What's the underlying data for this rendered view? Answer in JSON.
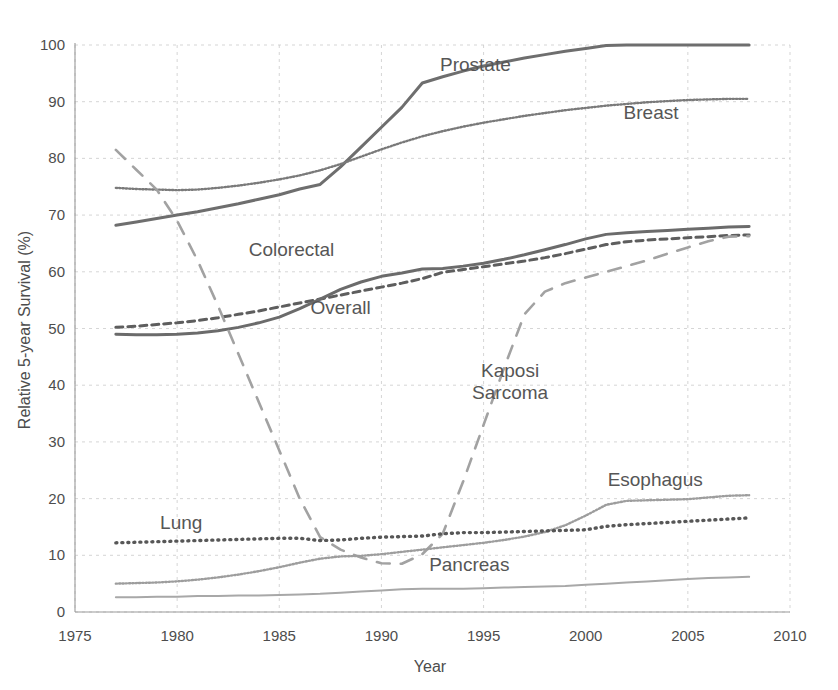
{
  "chart_data": {
    "type": "line",
    "title": "",
    "xlabel": "Year",
    "ylabel": "Relative 5-year Survival (%)",
    "xlim": [
      1975,
      2010
    ],
    "ylim": [
      0,
      100
    ],
    "xticks": [
      "1975",
      "1980",
      "1985",
      "1990",
      "1995",
      "2000",
      "2005",
      "2010"
    ],
    "yticks": [
      "0",
      "10",
      "20",
      "30",
      "40",
      "50",
      "60",
      "70",
      "80",
      "90",
      "100"
    ],
    "grid": true,
    "legend_position": "inline-annotations",
    "x": [
      1977,
      1978,
      1979,
      1980,
      1981,
      1982,
      1983,
      1984,
      1985,
      1986,
      1987,
      1988,
      1989,
      1990,
      1991,
      1992,
      1993,
      1994,
      1995,
      1996,
      1997,
      1998,
      1999,
      2000,
      2001,
      2002,
      2003,
      2004,
      2005,
      2006,
      2007,
      2008
    ],
    "series": [
      {
        "name": "Prostate",
        "color": "#6e6e6e",
        "style": "solid",
        "label_x": 1994.6,
        "label_y": 95.5,
        "values": [
          68.2,
          68.8,
          69.4,
          70.0,
          70.6,
          71.3,
          72.0,
          72.8,
          73.6,
          74.6,
          75.4,
          78.5,
          82.0,
          85.5,
          89.0,
          93.3,
          94.4,
          95.4,
          96.3,
          97.0,
          97.7,
          98.3,
          98.9,
          99.4,
          99.9,
          100.0,
          100.0,
          100.0,
          100.0,
          100.0,
          100.0,
          100.0
        ]
      },
      {
        "name": "Breast",
        "color": "#7a7a7a",
        "style": "dotted-fine",
        "label_x": 2003.2,
        "label_y": 87.0,
        "values": [
          74.8,
          74.6,
          74.5,
          74.4,
          74.5,
          74.8,
          75.2,
          75.7,
          76.3,
          77.0,
          77.9,
          79.0,
          80.3,
          81.6,
          82.8,
          83.9,
          84.8,
          85.6,
          86.3,
          86.9,
          87.5,
          88.0,
          88.5,
          88.9,
          89.3,
          89.6,
          89.9,
          90.1,
          90.3,
          90.4,
          90.5,
          90.5
        ]
      },
      {
        "name": "Colorectal",
        "color": "#5e5e5e",
        "style": "dashed",
        "label_x": 1985.6,
        "label_y": 62.8,
        "values": [
          50.2,
          50.4,
          50.7,
          51.0,
          51.4,
          51.9,
          52.5,
          53.1,
          53.8,
          54.5,
          55.2,
          55.9,
          56.6,
          57.3,
          58.0,
          58.8,
          59.9,
          60.4,
          60.9,
          61.4,
          61.9,
          62.5,
          63.2,
          64.0,
          64.8,
          65.3,
          65.6,
          65.8,
          66.0,
          66.2,
          66.4,
          66.5
        ]
      },
      {
        "name": "Overall",
        "color": "#6b6b6b",
        "style": "solid",
        "label_x": 1988.0,
        "label_y": 52.5,
        "values": [
          49.0,
          48.9,
          48.9,
          49.0,
          49.2,
          49.6,
          50.2,
          51.0,
          52.0,
          53.5,
          55.2,
          56.9,
          58.2,
          59.2,
          59.8,
          60.5,
          60.6,
          61.0,
          61.5,
          62.2,
          63.0,
          63.9,
          64.8,
          65.8,
          66.6,
          66.9,
          67.1,
          67.3,
          67.5,
          67.7,
          67.9,
          68.0
        ]
      },
      {
        "name": "Kaposi Sarcoma",
        "color": "#a2a2a2",
        "style": "long-dash",
        "label_x": 1996.3,
        "label_y": 41.5,
        "values": [
          81.5,
          78.0,
          74.5,
          69.0,
          62.0,
          54.0,
          45.5,
          37.0,
          28.5,
          20.0,
          13.2,
          11.0,
          9.6,
          8.6,
          8.5,
          10.2,
          13.8,
          23.0,
          33.0,
          43.0,
          52.5,
          56.5,
          58.0,
          59.0,
          60.0,
          61.0,
          62.0,
          63.2,
          64.3,
          65.4,
          66.2,
          66.3
        ]
      },
      {
        "name": "Esophagus",
        "color": "#9d9d9d",
        "style": "dotted-fine",
        "label_x": 2003.4,
        "label_y": 22.3,
        "values": [
          5.0,
          5.1,
          5.2,
          5.4,
          5.7,
          6.1,
          6.6,
          7.2,
          7.9,
          8.7,
          9.4,
          9.8,
          9.9,
          10.2,
          10.6,
          11.0,
          11.4,
          11.8,
          12.2,
          12.7,
          13.3,
          14.1,
          15.3,
          17.0,
          18.9,
          19.6,
          19.7,
          19.8,
          19.9,
          20.2,
          20.5,
          20.6
        ]
      },
      {
        "name": "Lung",
        "color": "#575757",
        "style": "dotted-thick",
        "label_x": 1980.2,
        "label_y": 14.6,
        "values": [
          12.2,
          12.3,
          12.4,
          12.5,
          12.6,
          12.7,
          12.8,
          12.9,
          13.0,
          13.0,
          12.6,
          12.7,
          13.0,
          13.2,
          13.3,
          13.4,
          13.8,
          14.0,
          14.0,
          14.1,
          14.2,
          14.3,
          14.4,
          14.5,
          15.1,
          15.4,
          15.6,
          15.8,
          16.0,
          16.2,
          16.4,
          16.6
        ]
      },
      {
        "name": "Pancreas",
        "color": "#a8a8a8",
        "style": "solid-thin",
        "label_x": 1994.3,
        "label_y": 7.2,
        "values": [
          2.6,
          2.6,
          2.7,
          2.7,
          2.8,
          2.8,
          2.9,
          2.9,
          3.0,
          3.1,
          3.2,
          3.4,
          3.6,
          3.8,
          4.0,
          4.1,
          4.1,
          4.1,
          4.2,
          4.3,
          4.4,
          4.5,
          4.6,
          4.8,
          5.0,
          5.2,
          5.4,
          5.6,
          5.8,
          6.0,
          6.1,
          6.2
        ]
      }
    ]
  }
}
